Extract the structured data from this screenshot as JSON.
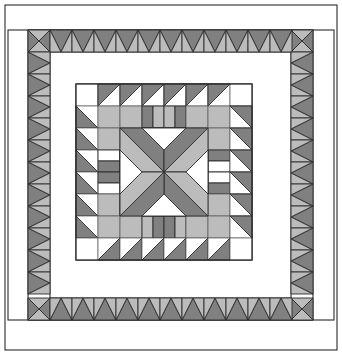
{
  "artwork": {
    "title": "Medallion Sawtooth Star Quilt Pattern",
    "type": "quilt-block-diagram",
    "width": 342,
    "height": 355
  },
  "palette": {
    "background": "#ffffff",
    "white": "#ffffff",
    "light_gray": "#bcbcbc",
    "dark_gray": "#808080",
    "outline": "#2b2b2b",
    "thin_outline": "#555555"
  },
  "frames": [
    {
      "name": "outer-frame",
      "x": 5,
      "y": 5,
      "w": 332,
      "h": 345,
      "fill": "#ffffff",
      "stroke": "#2b2b2b"
    },
    {
      "name": "outer-border-band",
      "x": 8,
      "y": 30,
      "w": 326,
      "h": 290,
      "fill": "#ffffff",
      "stroke": "#2b2b2b"
    },
    {
      "name": "sawtooth-frame",
      "x": 28,
      "y": 30,
      "w": 285,
      "h": 290,
      "fill": "#ffffff",
      "stroke": "#2b2b2b"
    },
    {
      "name": "inner-sashing-frame",
      "x": 50,
      "y": 52,
      "w": 241,
      "h": 246,
      "fill": "#ffffff",
      "stroke": "#2b2b2b"
    },
    {
      "name": "medallion-frame",
      "x": 76,
      "y": 84,
      "w": 176,
      "h": 176,
      "fill": "#ffffff",
      "stroke": "#2b2b2b"
    }
  ],
  "sawtooth_border": {
    "name": "flying-geese-sawtooth-border",
    "band": {
      "x": 28,
      "y": 30,
      "w": 285,
      "h": 290
    },
    "unit_size": 22,
    "corner_unit": "pinwheel-four-triangle",
    "top_units": 12,
    "bottom_units": 12,
    "left_units": 12,
    "right_units": 12,
    "colors": {
      "primary": "#808080",
      "secondary": "#bcbcbc"
    }
  },
  "medallion": {
    "name": "center-medallion",
    "origin": {
      "x": 76,
      "y": 84
    },
    "cell": 22,
    "rows": 8,
    "cols": 8,
    "description": "8x8 grid of half-square-triangle and quarter-square-triangle units forming an eight-pointed star with sawtooth rings",
    "grid": [
      [
        "w",
        "d0",
        "d0",
        "d0",
        "d0",
        "d0",
        "d0",
        "w"
      ],
      [
        "d3",
        "L",
        "L",
        "q_tb_dl",
        "q_tb_ld",
        "L",
        "L",
        "d1"
      ],
      [
        "d3",
        "L",
        "d2",
        "d0",
        "d0",
        "d2",
        "L",
        "d1"
      ],
      [
        "d3",
        "q_lr_wd",
        "d3",
        "S",
        "S",
        "d1",
        "q_lr_dw",
        "d1"
      ],
      [
        "d3",
        "q_lr_dw",
        "d2",
        "S",
        "S",
        "d0",
        "q_lr_wd",
        "d1"
      ],
      [
        "d3",
        "L",
        "d3",
        "d1",
        "d1",
        "d3",
        "L",
        "d1"
      ],
      [
        "d3",
        "L",
        "L",
        "q_tb_ld",
        "q_tb_dl",
        "L",
        "L",
        "d1"
      ],
      [
        "w",
        "d2",
        "d2",
        "d2",
        "d2",
        "d2",
        "d2",
        "w"
      ]
    ],
    "legend": {
      "w": "white square",
      "L": "light gray square",
      "d0": "half-square triangle, dark upper-left",
      "d1": "half-square triangle, dark upper-right",
      "d2": "half-square triangle, dark lower-right",
      "d3": "half-square triangle, dark lower-left",
      "S": "star point quarter unit",
      "q_tb_dl": "quarter-square, dark/light vertical split",
      "q_tb_ld": "quarter-square, light/dark vertical split",
      "q_lr_wd": "quarter-square, white/dark horizontal split",
      "q_lr_dw": "quarter-square, dark/white horizontal split"
    }
  }
}
